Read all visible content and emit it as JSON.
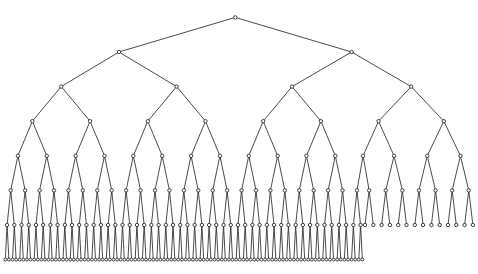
{
  "page": {
    "background_color": "#ffffff"
  },
  "diagram": {
    "type": "binary-tree",
    "total_nodes": 227,
    "full_levels": 7,
    "depth_levels": 8,
    "last_level_node_count": 100,
    "level6_parent_count": 50,
    "level6_leaf_count": 14,
    "level_node_counts": [
      1,
      2,
      4,
      8,
      16,
      32,
      64,
      100
    ],
    "node_fill": "#ffffff",
    "node_stroke": "#2b2b2b",
    "edge_color": "#2b2b2b",
    "layout": {
      "canvas_width": 478,
      "canvas_height": 274,
      "level_y_start": 17.4,
      "level_y_step": 34.6,
      "bottom_row": {
        "start_x": 5.3,
        "spacing": 3.607,
        "count": 100
      },
      "level6_leaves": {
        "start_x": 365.0,
        "spacing": 8.3,
        "count": 14
      },
      "node_radius": 1.7,
      "bottom_node_radius": 1.45,
      "edge_width": 0.85,
      "node_stroke_width": 0.9
    }
  }
}
